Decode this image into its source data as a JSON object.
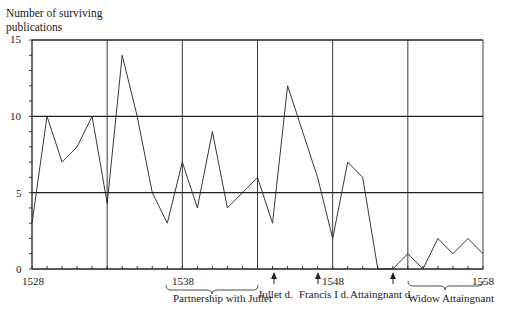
{
  "chart_data": {
    "type": "line",
    "title": "",
    "ylabel": "Number of surviving publications",
    "ylabel_lines": [
      "Number of surviving",
      "publications"
    ],
    "xlabel": "",
    "x": [
      1528,
      1529,
      1530,
      1531,
      1532,
      1533,
      1534,
      1535,
      1536,
      1537,
      1538,
      1539,
      1540,
      1541,
      1542,
      1543,
      1544,
      1545,
      1546,
      1547,
      1548,
      1549,
      1550,
      1551,
      1552,
      1553,
      1554,
      1555,
      1556,
      1557,
      1558
    ],
    "series": [
      {
        "name": "Surviving publications",
        "values": [
          3,
          10,
          7,
          8,
          10,
          4.3,
          14,
          10,
          5,
          3,
          7,
          4,
          9,
          4,
          5,
          6,
          3,
          12,
          9,
          6,
          2,
          7,
          6,
          0,
          0,
          1,
          0,
          2,
          1,
          2,
          1
        ]
      }
    ],
    "xlim": [
      1528,
      1558
    ],
    "ylim": [
      0,
      15
    ],
    "y_ticks_labeled": [
      0,
      5,
      10,
      15
    ],
    "x_ticks_labeled": [
      1528,
      1538,
      1548,
      1558
    ],
    "grid": {
      "horizontal_lines_at": [
        5,
        10,
        15
      ],
      "vertical_lines_at": [
        1533,
        1538,
        1543,
        1548,
        1553,
        1558
      ]
    },
    "annotations": [
      {
        "type": "brace",
        "label": "Partnership with Jullet",
        "from": 1537,
        "to": 1543
      },
      {
        "type": "arrow",
        "label": "Jullet d.",
        "at": 1544
      },
      {
        "type": "arrow",
        "label": "Francis I d.",
        "at": 1547
      },
      {
        "type": "arrow",
        "label": "Attaingnant d.",
        "at": 1552
      },
      {
        "type": "brace",
        "label": "Widow Attaingnant",
        "from": 1553,
        "to": 1558
      }
    ],
    "legend": null
  },
  "labels": {
    "ylabel_line1": "Number of surviving",
    "ylabel_line2": "publications",
    "y15": "15",
    "y10": "10",
    "y5": "5",
    "y0": "0",
    "x1528": "1528",
    "x1538": "1538",
    "x1548": "1548",
    "x1558": "1558",
    "partnership": "Partnership with Jullet",
    "jullet_death": "Jullet d.",
    "francis_death": "Francis I d.",
    "attaingnant_death": "Attaingnant d.",
    "widow": "Widow Attaingnant"
  }
}
